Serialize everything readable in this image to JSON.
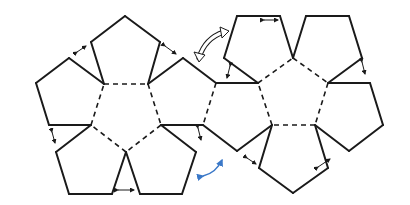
{
  "diagram": {
    "colors": {
      "background": "#ffffff",
      "edge": "#1a1a1a",
      "fold": "#1a1a1a",
      "gap_arrow": "#1a1a1a",
      "outline_arrow_fill": "#ffffff",
      "outline_arrow_stroke": "#1a1a1a",
      "blue_arrow": "#3a78c8"
    },
    "solid_edges": [
      [
        104,
        84,
        91,
        42
      ],
      [
        91,
        42,
        125,
        16
      ],
      [
        125,
        16,
        160,
        42
      ],
      [
        160,
        42,
        148,
        84
      ],
      [
        104,
        84,
        69,
        58
      ],
      [
        69,
        58,
        36,
        83
      ],
      [
        36,
        83,
        49,
        125
      ],
      [
        49,
        125,
        91,
        125
      ],
      [
        148,
        84,
        183,
        58
      ],
      [
        183,
        58,
        216,
        83
      ],
      [
        161,
        125,
        203,
        125
      ],
      [
        91,
        125,
        56,
        152
      ],
      [
        56,
        152,
        69,
        194
      ],
      [
        69,
        194,
        112,
        194
      ],
      [
        112,
        194,
        126,
        152
      ],
      [
        126,
        152,
        140,
        194
      ],
      [
        140,
        194,
        182,
        194
      ],
      [
        182,
        194,
        196,
        152
      ],
      [
        196,
        152,
        161,
        125
      ],
      [
        216,
        83,
        258,
        83
      ],
      [
        203,
        125,
        237,
        151
      ],
      [
        237,
        151,
        272,
        125
      ],
      [
        258,
        83,
        224,
        58
      ],
      [
        224,
        58,
        237,
        16
      ],
      [
        237,
        16,
        280,
        16
      ],
      [
        280,
        16,
        293,
        58
      ],
      [
        293,
        58,
        306,
        16
      ],
      [
        306,
        16,
        349,
        16
      ],
      [
        349,
        16,
        362,
        58
      ],
      [
        362,
        58,
        328,
        83
      ],
      [
        328,
        83,
        370,
        83
      ],
      [
        370,
        83,
        383,
        125
      ],
      [
        383,
        125,
        349,
        151
      ],
      [
        349,
        151,
        315,
        125
      ],
      [
        272,
        125,
        259,
        168
      ],
      [
        259,
        168,
        293,
        193
      ],
      [
        293,
        193,
        328,
        168
      ],
      [
        328,
        168,
        315,
        125
      ]
    ],
    "dashed_edges": [
      [
        104,
        84,
        148,
        84
      ],
      [
        148,
        84,
        161,
        125
      ],
      [
        161,
        125,
        126,
        152
      ],
      [
        126,
        152,
        91,
        125
      ],
      [
        91,
        125,
        104,
        84
      ],
      [
        216,
        83,
        203,
        125
      ],
      [
        258,
        83,
        293,
        58
      ],
      [
        293,
        58,
        328,
        83
      ],
      [
        328,
        83,
        315,
        125
      ],
      [
        315,
        125,
        272,
        125
      ],
      [
        272,
        125,
        258,
        83
      ]
    ],
    "gap_arrows": [
      [
        77,
        52,
        86,
        46
      ],
      [
        165,
        46,
        176,
        54
      ],
      [
        52,
        132,
        55,
        143
      ],
      [
        118,
        190,
        134,
        190
      ],
      [
        198,
        128,
        201,
        140
      ],
      [
        230,
        66,
        227,
        78
      ],
      [
        264,
        20,
        278,
        20
      ],
      [
        362,
        62,
        365,
        74
      ],
      [
        247,
        158,
        256,
        164
      ],
      [
        318,
        167,
        330,
        159
      ]
    ],
    "outline_arrow": {
      "from": [
        203,
        55
      ],
      "to": [
        222,
        35
      ]
    },
    "blue_arrow": {
      "from": [
        201,
        176
      ],
      "to": [
        222,
        160
      ]
    }
  }
}
